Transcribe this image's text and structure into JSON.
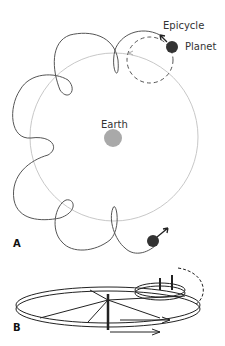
{
  "figure": {
    "panel_a": {
      "letter": "A",
      "labels": {
        "epicycle": "Epicycle",
        "planet": "Planet",
        "earth": "Earth"
      },
      "colors": {
        "deferent": "#c8c8c8",
        "earth": "#a9a9a9",
        "planet": "#333333",
        "path": "#555555"
      }
    },
    "panel_b": {
      "letter": "B"
    }
  }
}
